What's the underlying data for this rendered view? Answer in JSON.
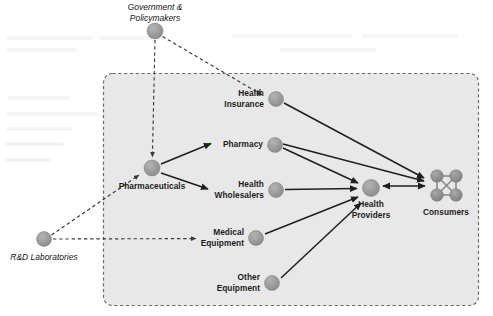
{
  "figure": {
    "type": "network-diagram",
    "boundary": {
      "name": "health-system-boundary",
      "style": "dashed-rounded-rectangle",
      "fill": "#e8e8e8",
      "stroke": "#6b6b6b"
    },
    "palette": {
      "node_fill": "#9a9a9a",
      "node_stroke": "#7a7a7a",
      "consumer_fill": "#8e8e8e",
      "solid_edge": "#1f1f1f",
      "dashed_edge": "#3a3a3a",
      "label_text": "#1c1c1c",
      "page_background": "#ffffff"
    }
  },
  "nodes": [
    {
      "id": "government",
      "label": "Government &\nPolicymakers",
      "style": "italic",
      "shape": "circle",
      "inside_boundary": false,
      "x": 155,
      "y": 31,
      "r": 8.0,
      "label_x": 155,
      "label_y": 3,
      "label_align": "center"
    },
    {
      "id": "rnd",
      "label": "R&D Laboratories",
      "style": "italic",
      "shape": "circle",
      "inside_boundary": false,
      "x": 44,
      "y": 239,
      "r": 7.5,
      "label_x": 44,
      "label_y": 252,
      "label_align": "center"
    },
    {
      "id": "pharmaceuticals",
      "label": "Pharmaceuticals",
      "style": "bold",
      "shape": "circle",
      "inside_boundary": true,
      "x": 152,
      "y": 168,
      "r": 8.0,
      "label_x": 152,
      "label_y": 181,
      "label_align": "center"
    },
    {
      "id": "health_insurance",
      "label": "Health\nInsurance",
      "style": "bold",
      "shape": "circle",
      "inside_boundary": true,
      "x": 276,
      "y": 99,
      "r": 7.5,
      "label_x": 264,
      "label_y": 88,
      "label_align": "right"
    },
    {
      "id": "pharmacy",
      "label": "Pharmacy",
      "style": "bold",
      "shape": "circle",
      "inside_boundary": true,
      "x": 275,
      "y": 145,
      "r": 7.5,
      "label_x": 263,
      "label_y": 139,
      "label_align": "right"
    },
    {
      "id": "health_wholesalers",
      "label": "Health\nWholesalers",
      "style": "bold",
      "shape": "circle",
      "inside_boundary": true,
      "x": 276,
      "y": 190,
      "r": 7.5,
      "label_x": 264,
      "label_y": 179,
      "label_align": "right"
    },
    {
      "id": "medical_equipment",
      "label": "Medical\nEquipment",
      "style": "bold",
      "shape": "circle",
      "inside_boundary": true,
      "x": 256,
      "y": 238,
      "r": 7.5,
      "label_x": 244,
      "label_y": 227,
      "label_align": "right"
    },
    {
      "id": "other_equipment",
      "label": "Other\nEquipment",
      "style": "bold",
      "shape": "circle",
      "inside_boundary": true,
      "x": 272,
      "y": 283,
      "r": 7.5,
      "label_x": 260,
      "label_y": 272,
      "label_align": "right"
    },
    {
      "id": "health_providers",
      "label": "Health\nProviders",
      "style": "bold",
      "shape": "circle",
      "inside_boundary": true,
      "x": 371,
      "y": 188,
      "r": 8.5,
      "label_x": 371,
      "label_y": 199,
      "label_align": "center"
    },
    {
      "id": "consumers",
      "label": "Consumers",
      "style": "bold",
      "shape": "cluster",
      "inside_boundary": true,
      "x": 446,
      "y": 185,
      "r": 7.0,
      "label_x": 446,
      "label_y": 207,
      "label_align": "center"
    }
  ],
  "edges": [
    {
      "from": "government",
      "to": "pharmaceuticals",
      "style": "dashed",
      "arrow": "single"
    },
    {
      "from": "government",
      "to": "health_insurance",
      "style": "dashed",
      "arrow": "single"
    },
    {
      "from": "rnd",
      "to": "pharmaceuticals",
      "style": "dashed",
      "arrow": "single"
    },
    {
      "from": "rnd",
      "to": "medical_equipment",
      "style": "dashed",
      "arrow": "single"
    },
    {
      "from": "pharmaceuticals",
      "to": "pharmacy",
      "style": "solid",
      "arrow": "single"
    },
    {
      "from": "pharmaceuticals",
      "to": "health_wholesalers",
      "style": "solid",
      "arrow": "single"
    },
    {
      "from": "health_insurance",
      "to": "consumers",
      "style": "solid",
      "arrow": "single"
    },
    {
      "from": "pharmacy",
      "to": "health_providers",
      "style": "solid",
      "arrow": "single"
    },
    {
      "from": "pharmacy",
      "to": "consumers",
      "style": "solid",
      "arrow": "single"
    },
    {
      "from": "health_wholesalers",
      "to": "health_providers",
      "style": "solid",
      "arrow": "single"
    },
    {
      "from": "medical_equipment",
      "to": "health_providers",
      "style": "solid",
      "arrow": "single"
    },
    {
      "from": "other_equipment",
      "to": "health_providers",
      "style": "solid",
      "arrow": "single"
    },
    {
      "from": "health_providers",
      "to": "consumers",
      "style": "solid",
      "arrow": "double"
    }
  ]
}
